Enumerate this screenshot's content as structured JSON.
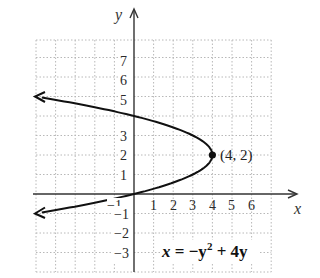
{
  "chart_data": {
    "type": "line",
    "title": "",
    "equation": "x = −y² + 4y",
    "xlabel": "x",
    "ylabel": "y",
    "xlim": [
      -5,
      7
    ],
    "ylim": [
      -4,
      8
    ],
    "grid": true,
    "x_ticks": [
      "−1",
      "1",
      "2",
      "3",
      "4",
      "5",
      "6"
    ],
    "y_ticks": [
      "7",
      "6",
      "5",
      "3",
      "2",
      "1",
      "−1",
      "−2",
      "−3"
    ],
    "series": [
      {
        "name": "x = −y² + 4y",
        "points": [
          {
            "x": -5,
            "y": 5
          },
          {
            "x": 0,
            "y": 4
          },
          {
            "x": 3,
            "y": 3
          },
          {
            "x": 4,
            "y": 2
          },
          {
            "x": 3,
            "y": 1
          },
          {
            "x": 0,
            "y": 0
          },
          {
            "x": -5,
            "y": -1
          }
        ]
      }
    ],
    "annotations": [
      {
        "text": "(4, 2)",
        "x": 4,
        "y": 2,
        "marker": "dot"
      }
    ]
  },
  "labels": {
    "x_axis": "x",
    "y_axis": "y",
    "vertex": "(4, 2)",
    "equation_lhs": "x",
    "equation_rhs": " = −y",
    "equation_exp": "2",
    "equation_tail": " + 4y"
  },
  "ticks": {
    "x": {
      "neg1": "−1",
      "p1": "1",
      "p2": "2",
      "p3": "3",
      "p4": "4",
      "p5": "5",
      "p6": "6"
    },
    "y": {
      "p7": "7",
      "p6": "6",
      "p5": "5",
      "p3": "3",
      "p2": "2",
      "p1": "1",
      "neg1": "−1",
      "neg2": "−2",
      "neg3": "−3"
    }
  },
  "colors": {
    "grid": "#b8b8b8",
    "axis": "#333333",
    "curve": "#111111"
  }
}
